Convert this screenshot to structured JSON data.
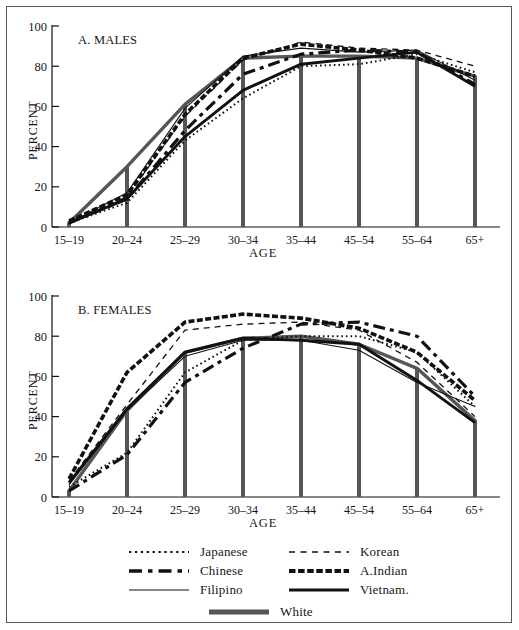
{
  "figure": {
    "background": "#ffffff",
    "frame_color": "#59595e",
    "line_color": "#111111",
    "white_bar_color": "#55555a"
  },
  "panels": [
    {
      "id": "males",
      "title": "A. MALES",
      "ylabel": "PERCENT",
      "xlabel": "AGE",
      "ylim": [
        0,
        100
      ],
      "yticks": [
        "0",
        "20",
        "40",
        "60",
        "80",
        "100"
      ],
      "xticks": [
        "15–19",
        "20–24",
        "25–29",
        "30–34",
        "35–44",
        "45–54",
        "55–64",
        "65+"
      ]
    },
    {
      "id": "females",
      "title": "B. FEMALES",
      "ylabel": "PERCENT",
      "xlabel": "AGE",
      "ylim": [
        0,
        100
      ],
      "yticks": [
        "0",
        "20",
        "40",
        "60",
        "80",
        "100"
      ],
      "xticks": [
        "15–19",
        "20–24",
        "25–29",
        "30–34",
        "35–44",
        "45–54",
        "55–64",
        "65+"
      ]
    }
  ],
  "legend": {
    "position": "bottom",
    "entries": [
      {
        "label": "Japanese",
        "style": "dotted-thin",
        "row": 0,
        "col": 0
      },
      {
        "label": "Korean",
        "style": "dashed-thin",
        "row": 0,
        "col": 1
      },
      {
        "label": "Chinese",
        "style": "dashdot-thick",
        "row": 1,
        "col": 0
      },
      {
        "label": "A.Indian",
        "style": "dotted-thick",
        "row": 1,
        "col": 1
      },
      {
        "label": "Filipino",
        "style": "solid-thin",
        "row": 2,
        "col": 0
      },
      {
        "label": "Vietnam.",
        "style": "solid-thick",
        "row": 2,
        "col": 1
      },
      {
        "label": "White",
        "style": "solid-bar",
        "row": 3,
        "col": 2
      }
    ]
  },
  "chart_data": [
    {
      "type": "line",
      "title": "A. MALES",
      "xlabel": "AGE",
      "ylabel": "PERCENT",
      "ylim": [
        0,
        100
      ],
      "yticks": [
        0,
        20,
        40,
        60,
        80,
        100
      ],
      "grid": false,
      "legend_position": "bottom",
      "categories": [
        "15–19",
        "20–24",
        "25–29",
        "30–34",
        "35–44",
        "45–54",
        "55–64",
        "65+"
      ],
      "series": [
        {
          "name": "Japanese",
          "style": "dotted-thin",
          "values": [
            2,
            12,
            43,
            64,
            80,
            81,
            86,
            77
          ]
        },
        {
          "name": "Korean",
          "style": "dashed-thin",
          "values": [
            2,
            15,
            55,
            83,
            92,
            89,
            88,
            80
          ]
        },
        {
          "name": "Chinese",
          "style": "dashdot-thick",
          "values": [
            2,
            14,
            48,
            76,
            86,
            88,
            87,
            71
          ]
        },
        {
          "name": "A.Indian",
          "style": "dotted-thick",
          "values": [
            3,
            16,
            56,
            84,
            91,
            88,
            84,
            75
          ]
        },
        {
          "name": "Filipino",
          "style": "solid-thin",
          "values": [
            2,
            17,
            59,
            85,
            89,
            87,
            88,
            73
          ]
        },
        {
          "name": "Vietnam.",
          "style": "solid-thick",
          "values": [
            2,
            14,
            45,
            68,
            81,
            84,
            87,
            70
          ]
        },
        {
          "name": "White",
          "style": "solid-bar",
          "values": [
            2,
            30,
            61,
            84,
            85,
            85,
            84,
            75
          ]
        }
      ]
    },
    {
      "type": "line",
      "title": "B. FEMALES",
      "xlabel": "AGE",
      "ylabel": "PERCENT",
      "ylim": [
        0,
        100
      ],
      "yticks": [
        0,
        20,
        40,
        60,
        80,
        100
      ],
      "grid": false,
      "legend_position": "bottom",
      "categories": [
        "15–19",
        "20–24",
        "25–29",
        "30–34",
        "35–44",
        "45–54",
        "55–64",
        "65+"
      ],
      "series": [
        {
          "name": "Japanese",
          "style": "dotted-thin",
          "values": [
            5,
            22,
            62,
            78,
            80,
            80,
            72,
            45
          ]
        },
        {
          "name": "Korean",
          "style": "dashed-thin",
          "values": [
            8,
            46,
            83,
            86,
            87,
            83,
            67,
            40
          ]
        },
        {
          "name": "Chinese",
          "style": "dashdot-thick",
          "values": [
            3,
            21,
            57,
            74,
            86,
            87,
            80,
            50
          ]
        },
        {
          "name": "A.Indian",
          "style": "dotted-thick",
          "values": [
            9,
            62,
            87,
            91,
            89,
            84,
            72,
            48
          ]
        },
        {
          "name": "Filipino",
          "style": "solid-thin",
          "values": [
            6,
            43,
            70,
            78,
            78,
            73,
            57,
            45
          ]
        },
        {
          "name": "Vietnam.",
          "style": "solid-thick",
          "values": [
            7,
            44,
            72,
            79,
            78,
            76,
            58,
            37
          ]
        },
        {
          "name": "White",
          "style": "solid-bar",
          "values": [
            3,
            43,
            72,
            79,
            80,
            76,
            64,
            38
          ]
        }
      ]
    }
  ]
}
